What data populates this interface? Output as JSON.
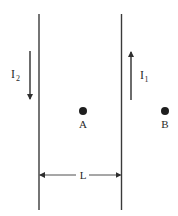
{
  "diagram": {
    "type": "physics-parallel-wires",
    "colors": {
      "stroke": "#3a3a3a",
      "text": "#2a2a2a",
      "background": "#ffffff"
    },
    "wires": [
      {
        "id": "left-wire",
        "current_label": "I",
        "current_subscript": "2",
        "current_direction": "down"
      },
      {
        "id": "right-wire",
        "current_label": "I",
        "current_subscript": "1",
        "current_direction": "up"
      }
    ],
    "points": [
      {
        "id": "A",
        "label": "A",
        "position": "between wires"
      },
      {
        "id": "B",
        "label": "B",
        "position": "right of right wire"
      }
    ],
    "separation": {
      "label": "L"
    }
  }
}
